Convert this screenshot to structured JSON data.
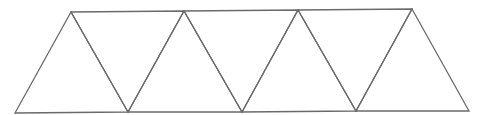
{
  "diagram": {
    "type": "triangle-strip",
    "stroke_color": "#6a6a6a",
    "background": "#ffffff",
    "top_vertices": [
      [
        71,
        12
      ],
      [
        184,
        11
      ],
      [
        298,
        10
      ],
      [
        412,
        9
      ]
    ],
    "bottom_vertices": [
      [
        15,
        113
      ],
      [
        128,
        112
      ],
      [
        242,
        112
      ],
      [
        356,
        111
      ],
      [
        469,
        111
      ]
    ],
    "triangle_count": 7,
    "triangles": [
      {
        "id": "up-1",
        "points": [
          [
            15,
            113
          ],
          [
            71,
            12
          ],
          [
            128,
            112
          ]
        ]
      },
      {
        "id": "down-1",
        "points": [
          [
            71,
            12
          ],
          [
            184,
            11
          ],
          [
            128,
            112
          ]
        ]
      },
      {
        "id": "up-2",
        "points": [
          [
            128,
            112
          ],
          [
            184,
            11
          ],
          [
            242,
            112
          ]
        ]
      },
      {
        "id": "down-2",
        "points": [
          [
            184,
            11
          ],
          [
            298,
            10
          ],
          [
            242,
            112
          ]
        ]
      },
      {
        "id": "up-3",
        "points": [
          [
            242,
            112
          ],
          [
            298,
            10
          ],
          [
            356,
            111
          ]
        ]
      },
      {
        "id": "down-3",
        "points": [
          [
            298,
            10
          ],
          [
            412,
            9
          ],
          [
            356,
            111
          ]
        ]
      },
      {
        "id": "up-4",
        "points": [
          [
            356,
            111
          ],
          [
            412,
            9
          ],
          [
            469,
            111
          ]
        ]
      }
    ]
  }
}
